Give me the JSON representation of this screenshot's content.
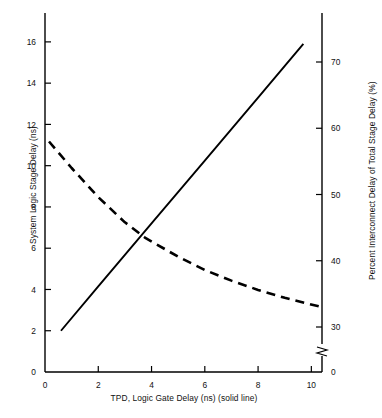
{
  "chart_data": {
    "type": "line",
    "title": "",
    "xlabel": "TPD, Logic Gate Delay (ns) (solid line)",
    "ylabel": "System Logic Stage Delay (ns)",
    "ylabel_right": "Percent Interconnect Delay of Total Stage Delay (%)",
    "xlim": [
      0,
      10.4
    ],
    "ylim": [
      0,
      17.4
    ],
    "ylim_right": [
      27.5,
      74.5
    ],
    "xticks": [
      0,
      2,
      4,
      6,
      8,
      10
    ],
    "xticklabels": [
      "0",
      "2",
      "4",
      "6",
      "8",
      "10"
    ],
    "yticks": [
      0,
      2,
      4,
      6,
      8,
      10,
      12,
      14,
      16
    ],
    "yticklabels": [
      "0",
      "2",
      "4",
      "6",
      "8",
      "10",
      "12",
      "14",
      "16"
    ],
    "yticks_right": [
      30,
      40,
      50,
      60,
      70
    ],
    "yticklabels_right": [
      "30",
      "40",
      "50",
      "60",
      "70"
    ],
    "right_axis_break": true,
    "right_axis_zero_label": "0",
    "grid": false,
    "legend": "none",
    "series": [
      {
        "name": "System Logic Stage Delay",
        "style": "solid",
        "axis": "left",
        "color": "#000000",
        "x": [
          0.6,
          2.0,
          4.0,
          6.0,
          8.0,
          9.7
        ],
        "values": [
          2.0,
          4.15,
          7.2,
          10.25,
          13.3,
          15.9
        ]
      },
      {
        "name": "Percent Interconnect Delay of Total Stage Delay",
        "style": "dashed",
        "axis": "right",
        "color": "#000000",
        "x": [
          0.15,
          1.0,
          2.0,
          3.0,
          3.75,
          5.0,
          6.0,
          7.0,
          8.0,
          9.0,
          10.4
        ],
        "values": [
          58.0,
          54.0,
          49.6,
          45.8,
          43.5,
          40.6,
          38.6,
          37.0,
          35.6,
          34.4,
          33.0
        ]
      }
    ],
    "annotations": {
      "crossover_note": "solid and dashed curves intersect near TPD = 3.75 ns"
    }
  }
}
